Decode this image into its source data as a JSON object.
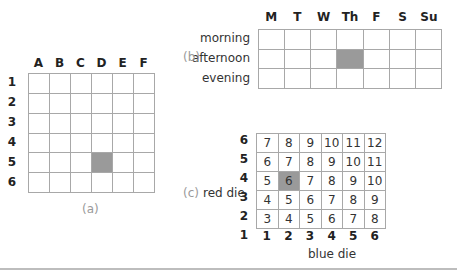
{
  "panel_a": {
    "caption": "(a)",
    "columns": [
      "A",
      "B",
      "C",
      "D",
      "E",
      "F"
    ],
    "rows": [
      "1",
      "2",
      "3",
      "4",
      "5",
      "6"
    ],
    "shaded": {
      "row": 4,
      "col": 3
    },
    "shaded_label": "D5"
  },
  "panel_b": {
    "caption": "(b)",
    "columns": [
      "M",
      "T",
      "W",
      "Th",
      "F",
      "S",
      "Su"
    ],
    "rows": [
      "morning",
      "afternoon",
      "evening"
    ],
    "shaded": {
      "row": 1,
      "col": 3
    },
    "shaded_label": "Thursday afternoon"
  },
  "panel_c": {
    "caption": "(c)",
    "row_axis_label": "red die",
    "col_axis_label": "blue die",
    "row_labels": [
      "6",
      "5",
      "4",
      "3",
      "2",
      "1"
    ],
    "col_labels": [
      "1",
      "2",
      "3",
      "4",
      "5",
      "6"
    ],
    "cells": [
      [
        "7",
        "8",
        "9",
        "10",
        "11",
        "12"
      ],
      [
        "6",
        "7",
        "8",
        "9",
        "10",
        "11"
      ],
      [
        "5",
        "6",
        "7",
        "8",
        "9",
        "10"
      ],
      [
        "4",
        "5",
        "6",
        "7",
        "8",
        "9"
      ],
      [
        "3",
        "4",
        "5",
        "6",
        "7",
        "8"
      ]
    ],
    "shaded": {
      "row": 2,
      "col": 1
    },
    "shaded_label": "red 4, blue 2 = 6"
  },
  "colors": {
    "grid_line": "#a8a8a8",
    "shade": "#9a9a9a",
    "caption": "#9a9a9a"
  }
}
